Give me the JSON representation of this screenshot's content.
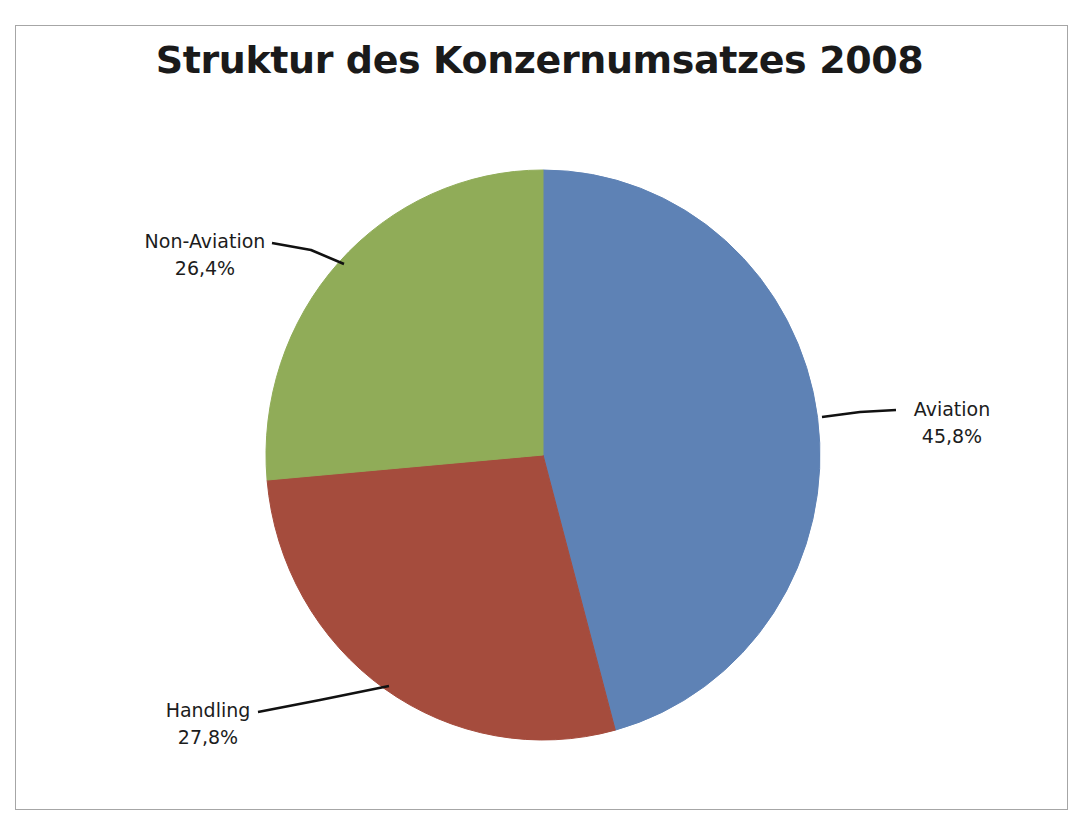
{
  "chart_data": {
    "type": "pie",
    "title": "Struktur des Konzernumsatzes 2008",
    "xlabel": "",
    "ylabel": "",
    "legend_position": "none",
    "grid": false,
    "value_format": "percent_comma",
    "start_angle_deg": 0,
    "direction": "clockwise",
    "categories": [
      "Aviation",
      "Handling",
      "Non-Aviation"
    ],
    "values": [
      45.8,
      27.8,
      26.4
    ],
    "labels": [
      "45,8%",
      "27,8%",
      "26,4%"
    ],
    "colors": [
      "#5e82b5",
      "#a54c3d",
      "#90ac58"
    ],
    "slices": [
      {
        "name": "Aviation",
        "value": 45.8,
        "value_label": "45,8%",
        "color": "#5e82b5",
        "callout_position": "right"
      },
      {
        "name": "Handling",
        "value": 27.8,
        "value_label": "27,8%",
        "color": "#a54c3d",
        "callout_position": "bottom-left"
      },
      {
        "name": "Non-Aviation",
        "value": 26.4,
        "value_label": "26,4%",
        "color": "#90ac58",
        "callout_position": "top-left"
      }
    ]
  },
  "frame": {
    "border_color": "#a6a6a6",
    "background": "#ffffff"
  },
  "title": {
    "text": "Struktur des Konzernumsatzes 2008"
  },
  "callouts": {
    "aviation": {
      "label": "Aviation",
      "percent": "45,8%"
    },
    "handling": {
      "label": "Handling",
      "percent": "27,8%"
    },
    "non_aviation": {
      "label": "Non-Aviation",
      "percent": "26,4%"
    }
  }
}
